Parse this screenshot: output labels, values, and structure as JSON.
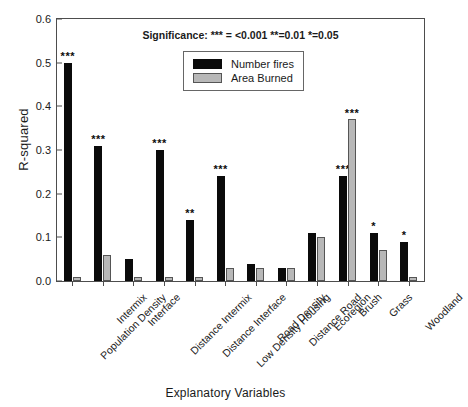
{
  "chart_data": {
    "type": "bar",
    "title": "",
    "xlabel": "Explanatory Variables",
    "ylabel": "R-squared",
    "ylim": [
      0.0,
      0.6
    ],
    "ytick_labels": [
      "0.0",
      "0.1",
      "0.2",
      "0.3",
      "0.4",
      "0.5",
      "0.6"
    ],
    "ytick_values": [
      0.0,
      0.1,
      0.2,
      0.3,
      0.4,
      0.5,
      0.6
    ],
    "grid": false,
    "legend_position": "upper center",
    "annotation": "Significance: *** = <0.001  **=0.01 *=0.05",
    "categories": [
      "Population Density",
      "Intermix",
      "Interface",
      "Distance Intermix",
      "Distance Interface",
      "Low Density Housing",
      "Road Density",
      "Distance Road",
      "Ecoregion",
      "Brush",
      "Grass",
      "Woodland"
    ],
    "series": [
      {
        "name": "Number fires",
        "color": "#0b0b0b",
        "values": [
          0.5,
          0.31,
          0.05,
          0.3,
          0.14,
          0.24,
          0.04,
          0.03,
          0.11,
          0.24,
          0.11,
          0.09
        ],
        "significance": [
          "***",
          "***",
          "",
          "***",
          "**",
          "***",
          "",
          "",
          "",
          "***",
          "*",
          "*"
        ]
      },
      {
        "name": "Area Burned",
        "color": "#b8b8b8",
        "values": [
          0.01,
          0.06,
          0.01,
          0.01,
          0.01,
          0.03,
          0.03,
          0.03,
          0.1,
          0.37,
          0.07,
          0.01
        ],
        "significance": [
          "",
          "",
          "",
          "",
          "",
          "",
          "",
          "",
          "",
          "***",
          "",
          ""
        ]
      }
    ]
  }
}
